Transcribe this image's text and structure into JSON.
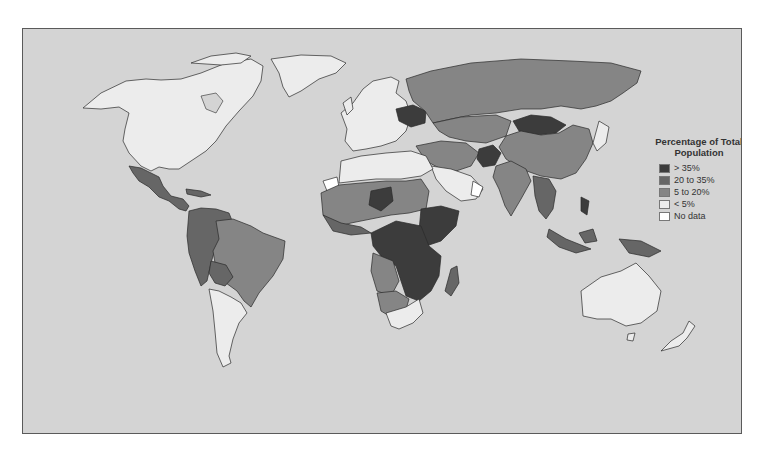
{
  "map": {
    "type": "choropleth",
    "region": "World",
    "background_color": "#d4d4d4",
    "border_color": "#2a2a2a"
  },
  "legend": {
    "title_line1": "Percentage of Total",
    "title_line2": "Population",
    "items": [
      {
        "label": "> 35%",
        "color": "#3c3c3c"
      },
      {
        "label": "20 to 35%",
        "color": "#666666"
      },
      {
        "label": "5 to 20%",
        "color": "#858585"
      },
      {
        "label": "< 5%",
        "color": "#ececec"
      },
      {
        "label": "No data",
        "color": "#ffffff"
      }
    ]
  },
  "regions": {
    "north_america": "< 5%",
    "greenland": "< 5%",
    "mexico_central_america": "20 to 35%",
    "south_america_north": "20 to 35%",
    "brazil": "5 to 20%",
    "argentina_chile_uruguay": "< 5%",
    "western_europe": "< 5%",
    "ukraine_belarus": "> 35%",
    "russia": "5 to 20%",
    "mongolia": "> 35%",
    "china": "5 to 20%",
    "india": "5 to 20%",
    "afghanistan": "> 35%",
    "north_africa": "< 5%",
    "sahel": "5 to 20%",
    "central_east_africa": "> 35%",
    "southern_africa": "< 5%",
    "madagascar": "20 to 35%",
    "southeast_asia": "20 to 35%",
    "indonesia_png": "20 to 35%",
    "japan_korea": "< 5%",
    "australia_nz": "< 5%",
    "western_sahara": "No data",
    "oman_yemen_coast": "No data"
  }
}
